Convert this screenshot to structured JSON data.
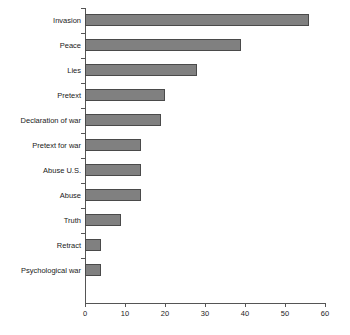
{
  "chart_data": {
    "type": "bar",
    "orientation": "horizontal",
    "title": "",
    "subtitle": "",
    "xlabel": "",
    "ylabel": "",
    "xlim": [
      0,
      60
    ],
    "xticks": [
      0,
      10,
      20,
      30,
      40,
      50,
      60
    ],
    "xtick_labels": [
      "0",
      "10",
      "20",
      "30",
      "40",
      "50",
      "60"
    ],
    "grid": false,
    "legend": null,
    "categories": [
      "Invasion",
      "Peace",
      "Lies",
      "Pretext",
      "Declaration of war",
      "Pretext for war",
      "Abuse U.S.",
      "Abuse",
      "Truth",
      "Retract",
      "Psychological war"
    ],
    "values": [
      56,
      39,
      28,
      20,
      19,
      14,
      14,
      14,
      9,
      4,
      4
    ],
    "series": [
      {
        "name": "",
        "values": [
          56,
          39,
          28,
          20,
          19,
          14,
          14,
          14,
          9,
          4,
          4
        ]
      }
    ],
    "colors": {
      "bar_fill": "#808080",
      "bar_border": "#4a4a4a",
      "axis": "#555555",
      "text": "#1a1a1a",
      "background": "#ffffff"
    }
  }
}
